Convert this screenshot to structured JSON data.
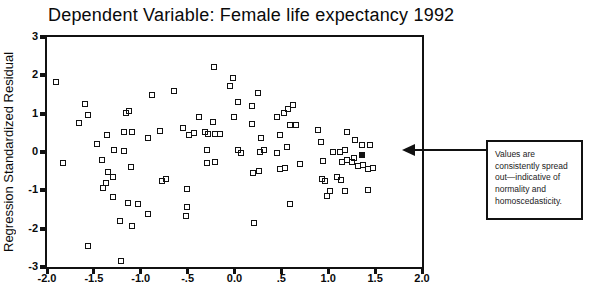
{
  "chart": {
    "title": "Dependent Variable: Female life expectancy 1992",
    "y_axis_label": "Regression Standardized Residual"
  },
  "annotation": {
    "text": "Values are consistently spread out—indicative of normality and homoscedasticity."
  },
  "colors": {
    "axis": "#111111",
    "marker_border": "#111111",
    "background": "#ffffff"
  },
  "chart_data": {
    "type": "scatter",
    "title": "Dependent Variable: Female life expectancy 1992",
    "xlabel": "",
    "ylabel": "Regression Standardized Residual",
    "xlim": [
      -2.0,
      2.0
    ],
    "ylim": [
      -3,
      3
    ],
    "grid": false,
    "legend": "none",
    "marker": "open-square",
    "xticks": [
      {
        "label": "-2.0",
        "value": -2.0
      },
      {
        "label": "-1.5",
        "value": -1.5
      },
      {
        "label": "-1.0",
        "value": -1.0
      },
      {
        "label": "-.5",
        "value": -0.5
      },
      {
        "label": "0.0",
        "value": 0.0
      },
      {
        "label": ".5",
        "value": 0.5
      },
      {
        "label": "1.0",
        "value": 1.0
      },
      {
        "label": "1.5",
        "value": 1.5
      },
      {
        "label": "2.0",
        "value": 2.0
      }
    ],
    "yticks": [
      {
        "label": "3",
        "value": 3
      },
      {
        "label": "2",
        "value": 2
      },
      {
        "label": "1",
        "value": 1
      },
      {
        "label": "0",
        "value": 0
      },
      {
        "label": "-1",
        "value": -1
      },
      {
        "label": "-2",
        "value": -2
      },
      {
        "label": "-3",
        "value": -3
      }
    ],
    "points": [
      [
        -1.9,
        1.83
      ],
      [
        -1.59,
        1.25
      ],
      [
        -1.56,
        0.97
      ],
      [
        -1.66,
        0.76
      ],
      [
        -1.47,
        0.21
      ],
      [
        -1.36,
        0.44
      ],
      [
        -1.29,
        0.05
      ],
      [
        -1.18,
        0.52
      ],
      [
        -1.16,
        1.02
      ],
      [
        -1.13,
        1.07
      ],
      [
        -1.09,
        0.52
      ],
      [
        -0.88,
        1.49
      ],
      [
        -0.92,
        0.37
      ],
      [
        -0.8,
        0.55
      ],
      [
        -0.65,
        1.59
      ],
      [
        -1.18,
        0.03
      ],
      [
        -0.22,
        2.22
      ],
      [
        -0.02,
        1.93
      ],
      [
        -0.05,
        1.72
      ],
      [
        0.25,
        1.54
      ],
      [
        0.04,
        1.3
      ],
      [
        0.19,
        1.2
      ],
      [
        0.62,
        1.22
      ],
      [
        0.57,
        1.12
      ],
      [
        0.53,
        1.01
      ],
      [
        0.45,
        0.91
      ],
      [
        -0.01,
        0.91
      ],
      [
        -0.38,
        0.91
      ],
      [
        -0.23,
        0.78
      ],
      [
        0.19,
        0.73
      ],
      [
        -0.55,
        0.63
      ],
      [
        -0.43,
        0.5
      ],
      [
        -0.49,
        0.44
      ],
      [
        -0.31,
        0.52
      ],
      [
        -0.28,
        0.47
      ],
      [
        -0.21,
        0.47
      ],
      [
        -0.15,
        0.47
      ],
      [
        0.59,
        0.7
      ],
      [
        0.66,
        0.7
      ],
      [
        0.49,
        0.44
      ],
      [
        0.28,
        0.37
      ],
      [
        -0.29,
        0.05
      ],
      [
        0.04,
        0.05
      ],
      [
        0.07,
        -0.03
      ],
      [
        0.27,
        0.0
      ],
      [
        0.31,
        0.05
      ],
      [
        0.56,
        0.13
      ],
      [
        0.45,
        -0.03
      ],
      [
        0.89,
        0.57
      ],
      [
        0.92,
        0.26
      ],
      [
        1.2,
        0.52
      ],
      [
        1.29,
        0.31
      ],
      [
        1.36,
        0.18
      ],
      [
        1.45,
        0.18
      ],
      [
        1.18,
        0.05
      ],
      [
        1.13,
        0.0
      ],
      [
        1.05,
        0.0
      ],
      [
        0.7,
        -0.31
      ],
      [
        0.94,
        -0.23
      ],
      [
        1.15,
        -0.26
      ],
      [
        1.2,
        -0.21
      ],
      [
        1.25,
        -0.26
      ],
      [
        1.27,
        -0.16
      ],
      [
        1.32,
        -0.37
      ],
      [
        1.37,
        -0.34
      ],
      [
        1.42,
        -0.44
      ],
      [
        1.48,
        -0.42
      ],
      [
        1.09,
        -0.65
      ],
      [
        1.14,
        -0.73
      ],
      [
        0.93,
        -0.7
      ],
      [
        0.97,
        -0.76
      ],
      [
        1.02,
        -1.02
      ],
      [
        1.18,
        -1.02
      ],
      [
        1.42,
        -0.99
      ],
      [
        0.99,
        -1.15
      ],
      [
        -1.83,
        -0.29
      ],
      [
        -1.41,
        -0.21
      ],
      [
        -1.35,
        -0.52
      ],
      [
        -1.3,
        -0.65
      ],
      [
        -1.1,
        -0.39
      ],
      [
        -1.37,
        -0.81
      ],
      [
        -1.4,
        -0.94
      ],
      [
        -1.3,
        -1.17
      ],
      [
        -1.14,
        -1.33
      ],
      [
        -1.03,
        -1.36
      ],
      [
        -0.92,
        -1.62
      ],
      [
        -1.22,
        -1.8
      ],
      [
        -1.09,
        -1.93
      ],
      [
        -0.77,
        -0.76
      ],
      [
        -0.73,
        -0.7
      ],
      [
        -1.56,
        -2.45
      ],
      [
        -1.21,
        -2.84
      ],
      [
        -0.29,
        -0.29
      ],
      [
        -0.21,
        -0.26
      ],
      [
        0.2,
        -0.55
      ],
      [
        0.26,
        -0.49
      ],
      [
        0.49,
        -0.44
      ],
      [
        0.54,
        -0.42
      ],
      [
        -0.51,
        -0.97
      ],
      [
        -0.51,
        -1.43
      ],
      [
        -0.52,
        -1.67
      ],
      [
        0.21,
        -1.85
      ],
      [
        0.59,
        -1.36
      ]
    ],
    "filled_points": [
      [
        1.36,
        -0.08
      ]
    ],
    "annotation": {
      "text": "Values are consistently spread out—indicative of normality and homoscedasticity.",
      "position": "right-of-plot, arrow pointing left at y=0"
    }
  }
}
